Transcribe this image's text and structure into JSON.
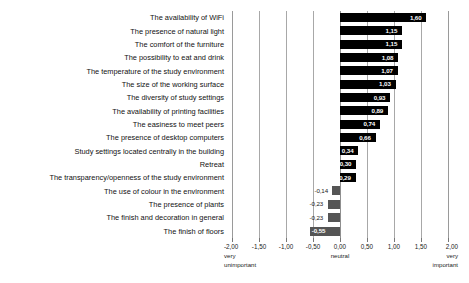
{
  "chart_data": {
    "type": "bar",
    "orientation": "horizontal",
    "title": "",
    "subtitle": "",
    "xlabel": "",
    "ylabel": "",
    "xlim": [
      -2.0,
      2.0
    ],
    "grid": true,
    "legend": null,
    "decimal_separator": ",",
    "categories": [
      "The availability of WiFi",
      "The presence of natural light",
      "The comfort of the furniture",
      "The possibility to eat and drink",
      "The temperature of the study environment",
      "The size of the working surface",
      "The diversity of study settings",
      "The availability of printing facilities",
      "The easiness to meet peers",
      "The presence of desktop computers",
      "Study settings located centrally in the building",
      "Retreat",
      "The transparency/openness of the study environment",
      "The use of colour in the environment",
      "The presence of plants",
      "The finish and decoration in general",
      "The finish of floors"
    ],
    "values": [
      1.6,
      1.15,
      1.15,
      1.08,
      1.07,
      1.03,
      0.93,
      0.89,
      0.74,
      0.66,
      0.34,
      0.3,
      0.29,
      -0.14,
      -0.23,
      -0.23,
      -0.55
    ],
    "value_labels": [
      "1,60",
      "1,15",
      "1,15",
      "1,08",
      "1,07",
      "1,03",
      "0,93",
      "0,89",
      "0,74",
      "0,66",
      "0,34",
      "0,30",
      "0,29",
      "-0,14",
      "-0,23",
      "-0,23",
      "-0,55"
    ],
    "xticks": [
      -2.0,
      -1.5,
      -1.0,
      -0.5,
      0.0,
      0.5,
      1.0,
      1.5,
      2.0
    ],
    "xtick_labels": [
      "-2,00",
      "-1,50",
      "-1,00",
      "-0,50",
      "0,00",
      "0,50",
      "1,00",
      "1,50",
      "2,00"
    ],
    "axis_anchors": [
      {
        "at": -2.0,
        "lines": [
          "very",
          "unimportant"
        ]
      },
      {
        "at": 0.0,
        "lines": [
          "neutral"
        ]
      },
      {
        "at": 2.0,
        "lines": [
          "very",
          "important"
        ]
      }
    ],
    "colors": {
      "positive_bar": "#000000",
      "negative_bar": "#555555",
      "gridline": "#a8a8a8",
      "background": "#ffffff",
      "text": "#1a1a1a"
    }
  }
}
